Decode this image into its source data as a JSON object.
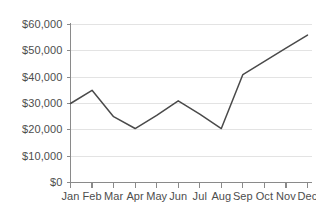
{
  "chart_data": {
    "type": "line",
    "title": "",
    "subtitle": "",
    "xlabel": "",
    "ylabel": "",
    "categories": [
      "Jan",
      "Feb",
      "Mar",
      "Apr",
      "May",
      "Jun",
      "Jul",
      "Aug",
      "Sep",
      "Oct",
      "Nov",
      "Dec"
    ],
    "values": [
      30000,
      35000,
      25000,
      20500,
      25500,
      31000,
      26000,
      20500,
      41000,
      46000,
      51000,
      56000
    ],
    "series": [
      {
        "name": "",
        "values": [
          30000,
          35000,
          25000,
          20500,
          25500,
          31000,
          26000,
          20500,
          41000,
          46000,
          51000,
          56000
        ],
        "color": "#4a4a4a"
      }
    ],
    "ylim": [
      0,
      60000
    ],
    "ytick_values": [
      0,
      10000,
      20000,
      30000,
      40000,
      50000,
      60000
    ],
    "ytick_labels": [
      "$0",
      "$10,000",
      "$20,000",
      "$30,000",
      "$40,000",
      "$50,000",
      "$60,000"
    ],
    "xtick_labels": [
      "Jan",
      "Feb",
      "Mar",
      "Apr",
      "May",
      "Jun",
      "Jul",
      "Aug",
      "Sep",
      "Oct",
      "Nov",
      "Dec"
    ],
    "grid": true,
    "grid_axis": "y",
    "legend": false,
    "legend_position": "none",
    "annotations": [],
    "colors": {
      "line": "#4a4a4a",
      "grid": "#e3e3e3",
      "axis": "#8a8a8a",
      "text": "#4d4d4d",
      "background": "#ffffff"
    }
  }
}
